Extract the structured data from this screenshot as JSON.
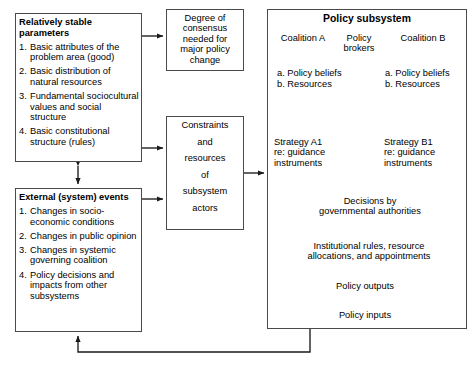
{
  "stable_parameters": {
    "heading": "Relatively stable parameters",
    "items": [
      {
        "num": "1.",
        "text": "Basic attributes of the problem area (good)"
      },
      {
        "num": "2.",
        "text": "Basic distribution of natural resources"
      },
      {
        "num": "3.",
        "text": "Fundamental sociocultural values and social structure"
      },
      {
        "num": "4.",
        "text": "Basic constitutional structure (rules)"
      }
    ]
  },
  "external_events": {
    "heading": "External (system) events",
    "items": [
      {
        "num": "1.",
        "text": "Changes in socio-economic conditions"
      },
      {
        "num": "2.",
        "text": "Changes in public opinion"
      },
      {
        "num": "3.",
        "text": "Changes in systemic governing coalition"
      },
      {
        "num": "4.",
        "text": "Policy decisions and impacts from other subsystems"
      }
    ]
  },
  "degree_box": {
    "lines": [
      "Degree of",
      "consensus",
      "needed for",
      "major policy",
      "change"
    ]
  },
  "constraints_box": {
    "lines": [
      "Constraints",
      "and",
      "resources",
      "of",
      "subsystem",
      "actors"
    ]
  },
  "subsystem": {
    "title": "Policy subsystem",
    "coalition_a": "Coalition A",
    "brokers": [
      "Policy",
      "brokers"
    ],
    "coalition_b": "Coalition B",
    "beliefs_a": [
      "a. Policy beliefs",
      "b. Resources"
    ],
    "beliefs_b": [
      "a. Policy beliefs",
      "b. Resources"
    ],
    "strategy_a": [
      "Strategy A1",
      "re: guidance",
      "instruments"
    ],
    "strategy_b": [
      "Strategy B1",
      "re: guidance",
      "instruments"
    ],
    "decisions": [
      "Decisions by",
      "governmental authorities"
    ],
    "institutional": [
      "Institutional rules, resource",
      "allocations, and appointments"
    ],
    "policy_outputs": "Policy outputs",
    "policy_inputs": "Policy inputs"
  },
  "colors": {
    "stroke": "#4a4a4a",
    "arrow": "#1a1a1a",
    "background": "#ffffff"
  }
}
